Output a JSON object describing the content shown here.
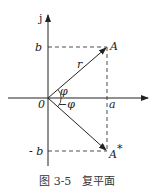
{
  "diagram": {
    "axes": {
      "imag_label": "j",
      "origin_label": "0"
    },
    "labels": {
      "b": "b",
      "neg_b": "- b",
      "a": "a",
      "A": "A",
      "A_conj": "A",
      "A_conj_sup": "*",
      "r": "r",
      "phi": "φ",
      "neg_phi": "−φ"
    },
    "caption": {
      "figure": "图 3-5",
      "title": "复平面"
    }
  }
}
